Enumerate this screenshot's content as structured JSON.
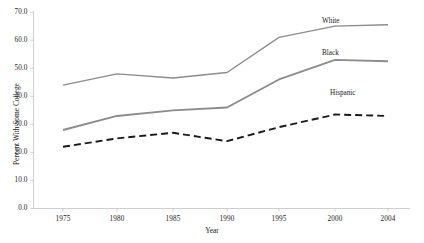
{
  "chart_data": {
    "type": "line",
    "title": "",
    "xlabel": "Year",
    "ylabel": "Percent With Some College",
    "categories": [
      "1975",
      "1980",
      "1985",
      "1990",
      "1995",
      "2000",
      "2004"
    ],
    "ylim": [
      0.0,
      70.0
    ],
    "yticks": [
      "0.0",
      "10.0",
      "20.0",
      "30.0",
      "40.0",
      "50.0",
      "60.0",
      "70.0"
    ],
    "ytick_values": [
      0,
      10,
      20,
      30,
      40,
      50,
      60,
      70
    ],
    "grid": false,
    "legend_position": "inline-right-of-series",
    "series": [
      {
        "name": "White",
        "values": [
          44.0,
          48.0,
          46.5,
          48.5,
          61.0,
          65.0,
          65.5
        ],
        "color": "#8c8c8c",
        "style": "solid",
        "width": 1.4
      },
      {
        "name": "Black",
        "values": [
          28.0,
          33.0,
          35.0,
          36.0,
          46.0,
          53.0,
          52.5
        ],
        "color": "#8c8c8c",
        "style": "solid",
        "width": 1.9
      },
      {
        "name": "Hispanic",
        "values": [
          22.0,
          25.0,
          27.0,
          24.0,
          29.0,
          33.5,
          33.0
        ],
        "color": "#1a1a1a",
        "style": "dashed",
        "width": 1.9
      }
    ]
  },
  "axis": {
    "line_color": "#c8c8c8",
    "tick_color": "#c8c8c8"
  }
}
